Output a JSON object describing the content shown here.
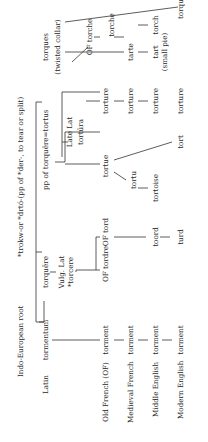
{
  "rows": {
    "ie": "Indo-European root",
    "latin": "Latin",
    "old_french": "Old French (OF)",
    "medieval_french": "Medieval French",
    "middle_english": "Middle English",
    "modern_english": "Modern English"
  },
  "ie_root": "*trokw-or *drtó-(pp of *der-, to tear or split)",
  "latin": {
    "tormentum": "tormentum",
    "torquere": "torquēre",
    "vulg_lat": "Vulg. Lat",
    "vulg_torcere": "*torcere",
    "pp": "pp of torquēre=tortus",
    "late_lat": "Late Lat",
    "tortura": "tortūra",
    "torques": "torques",
    "torques_gloss": "(twisted collar)"
  },
  "old_french": {
    "torment": "torment",
    "tordre": "OF tordre",
    "tord": "OF tord",
    "torture": "torture",
    "tortue": "tortue",
    "torche": "OF torche"
  },
  "medieval_french": {
    "torment": "torment",
    "torture": "torture",
    "tarte": "tarte",
    "torche": "torche"
  },
  "middle_english": {
    "torment": "torment",
    "toord": "toord",
    "tortu": "tortu",
    "torture": "torture"
  },
  "modern_english": {
    "torment": "torment",
    "turd": "turd",
    "tortoise": "tortoise",
    "tort": "tort",
    "torture": "torture",
    "tart": "tart",
    "tart_gloss": "(small pie)",
    "torch": "torch",
    "torque": "torque"
  }
}
